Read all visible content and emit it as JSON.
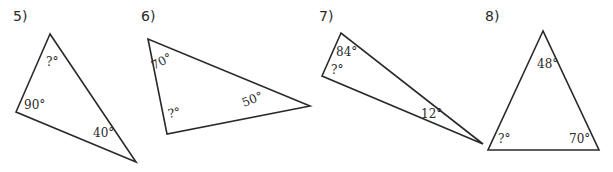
{
  "problems": [
    {
      "number": "5)",
      "vertices": [
        [
          50,
          34
        ],
        [
          16,
          112
        ],
        [
          136,
          162
        ]
      ],
      "angles": [
        "?°",
        "90°",
        "40°"
      ]
    },
    {
      "number": "6)",
      "vertices": [
        [
          148,
          39
        ],
        [
          167,
          134
        ],
        [
          310,
          106
        ]
      ],
      "angles": [
        "70°",
        "?°",
        "50°"
      ]
    },
    {
      "number": "7)",
      "vertices": [
        [
          341,
          33
        ],
        [
          322,
          76
        ],
        [
          483,
          144
        ]
      ],
      "angles": [
        "84°",
        "?°",
        "12°"
      ]
    },
    {
      "number": "8)",
      "vertices": [
        [
          543,
          31
        ],
        [
          488,
          150
        ],
        [
          599,
          150
        ]
      ],
      "angles": [
        "48°",
        "?°",
        "70°"
      ]
    }
  ]
}
